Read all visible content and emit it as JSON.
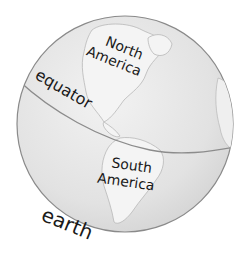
{
  "diagram": {
    "type": "labeled-globe",
    "labels": {
      "north_america": [
        "North",
        "America"
      ],
      "south_america": [
        "South",
        "America"
      ],
      "equator": "equator",
      "caption": "earth"
    },
    "colors": {
      "ocean": "#e4e4e4",
      "land": "#f3f3f3",
      "outline": "#8a8a8a",
      "equator_line": "#8c8c8c",
      "text": "#1a1a1a"
    }
  }
}
